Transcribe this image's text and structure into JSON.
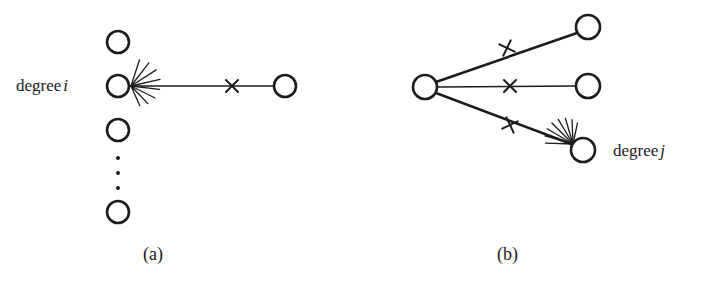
{
  "figure": {
    "background_color": "#ffffff",
    "stroke_color": "#1c1c1c",
    "width": 707,
    "height": 286,
    "labels": {
      "degree_i_prefix": "degree",
      "degree_i_variable": "i",
      "degree_j_prefix": "degree",
      "degree_j_variable": "j"
    },
    "captions": {
      "panel_a": "(a)",
      "panel_b": "(b)"
    }
  },
  "panel_a": {
    "caption": "(a)",
    "label": "degree i",
    "hub_node": {
      "cx": 118,
      "cy": 86,
      "r": 11
    },
    "stacked_nodes": [
      {
        "cx": 118,
        "cy": 42,
        "r": 11
      },
      {
        "cx": 118,
        "cy": 86,
        "r": 11
      },
      {
        "cx": 118,
        "cy": 130,
        "r": 11
      },
      {
        "cx": 118,
        "cy": 212,
        "r": 11
      }
    ],
    "ellipsis_dots": [
      {
        "cx": 118,
        "cy": 158,
        "r": 2
      },
      {
        "cx": 118,
        "cy": 173,
        "r": 2
      },
      {
        "cx": 118,
        "cy": 188,
        "r": 2
      }
    ],
    "target_node": {
      "cx": 285,
      "cy": 86,
      "r": 11
    },
    "edge": {
      "x1": 130,
      "y1": 86,
      "x2": 274,
      "y2": 86
    },
    "cross_marks": [
      {
        "cx": 232,
        "cy": 86,
        "size": 6,
        "rotation": 0
      }
    ],
    "stub_fan": {
      "origin_x": 131,
      "origin_y": 86,
      "count": 8,
      "length": 30,
      "angle_start": -72,
      "angle_end": 66
    }
  },
  "panel_b": {
    "caption": "(b)",
    "label": "degree j",
    "hub_node": {
      "cx": 425,
      "cy": 87,
      "r": 12
    },
    "target_nodes": [
      {
        "cx": 588,
        "cy": 27,
        "r": 12
      },
      {
        "cx": 588,
        "cy": 86,
        "r": 12
      },
      {
        "cx": 583,
        "cy": 150,
        "r": 12
      }
    ],
    "edges": [
      {
        "x1": 436,
        "y1": 82,
        "x2": 577,
        "y2": 33,
        "weight": "thick"
      },
      {
        "x1": 437,
        "y1": 87,
        "x2": 576,
        "y2": 86,
        "weight": "thin"
      },
      {
        "x1": 436,
        "y1": 93,
        "x2": 574,
        "y2": 145,
        "weight": "thick"
      }
    ],
    "cross_marks": [
      {
        "cx": 507,
        "cy": 48,
        "size": 6,
        "rotation": -19
      },
      {
        "cx": 510,
        "cy": 86,
        "size": 6,
        "rotation": 0
      },
      {
        "cx": 510,
        "cy": 125,
        "size": 6,
        "rotation": 20
      }
    ],
    "stub_fan": {
      "origin_x": 573,
      "origin_y": 144,
      "count": 8,
      "length": 30,
      "angle_start": 182,
      "angle_end": 282
    }
  }
}
